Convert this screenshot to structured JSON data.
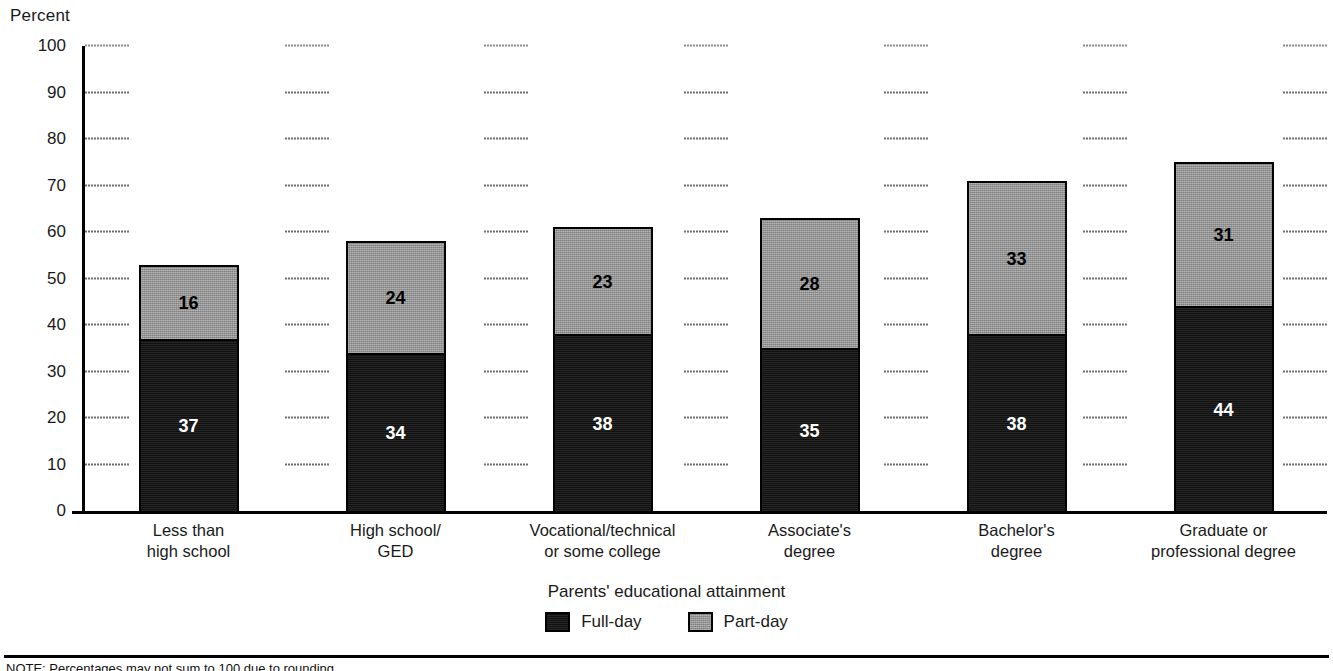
{
  "chart_data": {
    "type": "bar",
    "subtype": "stacked-vertical",
    "title": "",
    "xlabel": "Parents' educational attainment",
    "ylabel": "Percent",
    "ylim": [
      0,
      100
    ],
    "ytick_step": 10,
    "yticks": [
      "100",
      "90",
      "80",
      "70",
      "60",
      "50",
      "40",
      "30",
      "20",
      "10",
      "0"
    ],
    "ytick_values": [
      100,
      90,
      80,
      70,
      60,
      50,
      40,
      30,
      20,
      10,
      0
    ],
    "grid": "dashed-horizontal",
    "legend_position": "bottom-center",
    "categories": [
      "Less than high school",
      "High school/GED",
      "Vocational/technical or some college",
      "Associate's degree",
      "Bachelor's degree",
      "Graduate or professional degree"
    ],
    "category_lines": [
      [
        "Less than",
        "high school"
      ],
      [
        "High school/",
        "GED"
      ],
      [
        "Vocational/technical",
        "or some college"
      ],
      [
        "Associate's",
        "degree"
      ],
      [
        "Bachelor's",
        "degree"
      ],
      [
        "Graduate or",
        "professional degree"
      ]
    ],
    "series": [
      {
        "name": "Full-day",
        "color": "#161616",
        "values": [
          37,
          34,
          38,
          35,
          38,
          44
        ]
      },
      {
        "name": "Part-day",
        "color": "#9a9a9a",
        "values": [
          16,
          24,
          23,
          28,
          33,
          31
        ]
      }
    ],
    "stack_totals": [
      53,
      57,
      60,
      61,
      69,
      72
    ],
    "bar_outline_color": "#000000"
  },
  "legend": {
    "items": [
      {
        "label": "Full-day",
        "swatch": "full"
      },
      {
        "label": "Part-day",
        "swatch": "part"
      }
    ]
  },
  "footer": {
    "note": "NOTE: Percentages may not sum to 100 due to rounding."
  }
}
